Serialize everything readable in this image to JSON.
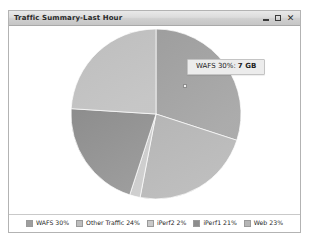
{
  "window": {
    "title": "Traffic Summary-Last Hour",
    "controls": {
      "minimize_label": "–",
      "maximize_label": "□",
      "close_label": "✕"
    }
  },
  "tooltip": {
    "label": "WAFS 30%:",
    "value": "7 GB"
  },
  "colors": {
    "wafs": "#9e9e9e",
    "web": "#b5b5b5",
    "iperf2": "#c9c9c9",
    "iperf1": "#8d8d8d",
    "other_traffic": "#bdbdbd",
    "border": "#b3b3b3",
    "titlebar_text": "#2a2a2a"
  },
  "chart_data": {
    "type": "pie",
    "title": "Traffic Summary-Last Hour",
    "legend_position": "bottom",
    "start_angle": 0,
    "direction": "clockwise",
    "categories": [
      "WAFS",
      "Web",
      "iPerf2",
      "iPerf1",
      "Other Traffic"
    ],
    "values": [
      30,
      23,
      2,
      21,
      24
    ],
    "unit": "%",
    "slices": [
      {
        "name": "WAFS",
        "percent": 30,
        "label": "WAFS 30%",
        "color": "#9e9e9e",
        "value": "7 GB"
      },
      {
        "name": "Web",
        "percent": 23,
        "label": "Web 23%",
        "color": "#b5b5b5"
      },
      {
        "name": "iPerf2",
        "percent": 2,
        "label": "iPerf2 2%",
        "color": "#c9c9c9"
      },
      {
        "name": "iPerf1",
        "percent": 21,
        "label": "iPerf1 21%",
        "color": "#8d8d8d"
      },
      {
        "name": "Other Traffic",
        "percent": 24,
        "label": "Other Traffic 24%",
        "color": "#bdbdbd"
      }
    ]
  },
  "legend": {
    "items": [
      {
        "label": "WAFS 30%",
        "color": "#9e9e9e"
      },
      {
        "label": "Other Traffic 24%",
        "color": "#bdbdbd"
      },
      {
        "label": "iPerf2 2%",
        "color": "#c9c9c9"
      },
      {
        "label": "iPerf1 21%",
        "color": "#8d8d8d"
      },
      {
        "label": "Web 23%",
        "color": "#b5b5b5"
      }
    ]
  }
}
